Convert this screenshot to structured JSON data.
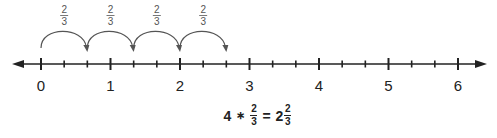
{
  "number_line": {
    "min": 0,
    "max": 6,
    "subdivisions": 3,
    "labels": [
      "0",
      "1",
      "2",
      "3",
      "4",
      "5",
      "6"
    ],
    "color": "#222222"
  },
  "jumps": {
    "count": 4,
    "start": 0,
    "step": 0.6667,
    "labels": [
      {
        "num": "2",
        "den": "3"
      },
      {
        "num": "2",
        "den": "3"
      },
      {
        "num": "2",
        "den": "3"
      },
      {
        "num": "2",
        "den": "3"
      }
    ],
    "color": "#555555"
  },
  "equation": {
    "left": "4",
    "operator": "∗",
    "frac_num": "2",
    "frac_den": "3",
    "equals": "=",
    "whole": "2",
    "result_num": "2",
    "result_den": "3"
  }
}
